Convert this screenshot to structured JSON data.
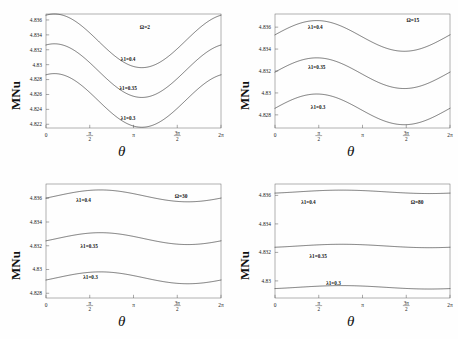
{
  "figure": {
    "axis_labels": {
      "y": "MNu",
      "x": "θ"
    },
    "xtick_labels": [
      "0",
      "π/2",
      "π",
      "3π/2",
      "2π"
    ],
    "xtick_values": [
      0,
      1.5707963,
      3.1415927,
      4.712389,
      6.2831853
    ],
    "curve_series_labels": [
      "λ1=0.4",
      "λ1=0.35",
      "λ1=0.3"
    ]
  },
  "chart_data": [
    {
      "type": "line",
      "title": "Ω=2",
      "panel": "top-left",
      "xlabel": "θ",
      "ylabel": "MNu",
      "xlim": [
        0,
        6.2831853
      ],
      "ylim": [
        4.8215,
        4.8368
      ],
      "xticks": [
        0,
        1.5707963,
        3.1415927,
        4.712389,
        6.2831853
      ],
      "xticklabels": [
        "0",
        "π/2",
        "π",
        "3π/2",
        "2π"
      ],
      "yticks": [
        4.822,
        4.824,
        4.826,
        4.828,
        4.83,
        4.832,
        4.834,
        4.836
      ],
      "yticklabels": [
        "4.822",
        "4.824",
        "4.826",
        "4.828",
        "4.83",
        "4.832",
        "4.834",
        "4.836"
      ],
      "grid": false,
      "legend": "inline-annotations",
      "annotations": [
        {
          "text": "Ω=2",
          "x": 3.55,
          "y": 4.8348
        },
        {
          "text": "λ1=0.4",
          "x": 2.95,
          "y": 4.8305
        },
        {
          "text": "λ1=0.35",
          "x": 2.95,
          "y": 4.8266
        },
        {
          "text": "λ1=0.3",
          "x": 2.95,
          "y": 4.8226
        }
      ],
      "series": [
        {
          "name": "λ1=0.4",
          "mean": 4.8332,
          "amplitude": 0.0036,
          "phase_peak": 0.3,
          "min_at": 3.62
        },
        {
          "name": "λ1=0.35",
          "mean": 4.8292,
          "amplitude": 0.0036,
          "phase_peak": 0.3,
          "min_at": 3.62
        },
        {
          "name": "λ1=0.3",
          "mean": 4.8252,
          "amplitude": 0.0036,
          "phase_peak": 0.3,
          "min_at": 3.62
        }
      ]
    },
    {
      "type": "line",
      "title": "Ω=15",
      "panel": "top-right",
      "xlabel": "θ",
      "ylabel": "MNu",
      "xlim": [
        0,
        6.2831853
      ],
      "ylim": [
        4.8268,
        4.8372
      ],
      "xticks": [
        0,
        1.5707963,
        3.1415927,
        4.712389,
        6.2831853
      ],
      "xticklabels": [
        "0",
        "π/2",
        "π",
        "3π/2",
        "2π"
      ],
      "yticks": [
        4.828,
        4.83,
        4.832,
        4.834,
        4.836
      ],
      "yticklabels": [
        "4.828",
        "4.83",
        "4.832",
        "4.834",
        "4.836"
      ],
      "grid": false,
      "legend": "inline-annotations",
      "annotations": [
        {
          "text": "Ω=15",
          "x": 4.95,
          "y": 4.8365
        },
        {
          "text": "λ1=0.4",
          "x": 1.45,
          "y": 4.8358
        },
        {
          "text": "λ1=0.35",
          "x": 1.5,
          "y": 4.8322
        },
        {
          "text": "λ1=0.3",
          "x": 1.55,
          "y": 4.8285
        }
      ],
      "series": [
        {
          "name": "λ1=0.4",
          "mean": 4.8352,
          "amplitude": 0.0014,
          "phase_peak": 1.5,
          "min_at": 4.65
        },
        {
          "name": "λ1=0.35",
          "mean": 4.8318,
          "amplitude": 0.0014,
          "phase_peak": 1.5,
          "min_at": 4.65
        },
        {
          "name": "λ1=0.3",
          "mean": 4.8285,
          "amplitude": 0.0014,
          "phase_peak": 1.5,
          "min_at": 4.65
        }
      ]
    },
    {
      "type": "line",
      "title": "Ω=30",
      "panel": "bottom-left",
      "xlabel": "θ",
      "ylabel": "MNu",
      "xlim": [
        0,
        6.2831853
      ],
      "ylim": [
        4.8276,
        4.8372
      ],
      "xticks": [
        0,
        1.5707963,
        3.1415927,
        4.712389,
        6.2831853
      ],
      "xticklabels": [
        "0",
        "π/2",
        "π",
        "3π/2",
        "2π"
      ],
      "yticks": [
        4.828,
        4.83,
        4.832,
        4.834,
        4.836
      ],
      "yticklabels": [
        "4.828",
        "4.83",
        "4.832",
        "4.834",
        "4.836"
      ],
      "grid": false,
      "legend": "inline-annotations",
      "annotations": [
        {
          "text": "Ω=30",
          "x": 4.85,
          "y": 4.836
        },
        {
          "text": "λ1=0.4",
          "x": 1.35,
          "y": 4.8357
        },
        {
          "text": "λ1=0.35",
          "x": 1.55,
          "y": 4.8318
        },
        {
          "text": "λ1=0.3",
          "x": 1.6,
          "y": 4.8292
        }
      ],
      "series": [
        {
          "name": "λ1=0.4",
          "mean": 4.8362,
          "amplitude": 0.0005,
          "phase_peak": 1.95,
          "min_at": 5.1
        },
        {
          "name": "λ1=0.35",
          "mean": 4.8326,
          "amplitude": 0.0005,
          "phase_peak": 1.95,
          "min_at": 5.1
        },
        {
          "name": "λ1=0.3",
          "mean": 4.8293,
          "amplitude": 0.0005,
          "phase_peak": 1.95,
          "min_at": 5.1
        }
      ]
    },
    {
      "type": "line",
      "title": "Ω=80",
      "panel": "bottom-right",
      "xlabel": "θ",
      "ylabel": "MNu",
      "xlim": [
        0,
        6.2831853
      ],
      "ylim": [
        4.8288,
        4.8368
      ],
      "xticks": [
        0,
        1.5707963,
        3.1415927,
        4.712389,
        6.2831853
      ],
      "xticklabels": [
        "0",
        "π/2",
        "π",
        "3π/2",
        "2π"
      ],
      "yticks": [
        4.83,
        4.832,
        4.834,
        4.836
      ],
      "yticklabels": [
        "4.83",
        "4.832",
        "4.834",
        "4.836"
      ],
      "grid": false,
      "legend": "inline-annotations",
      "annotations": [
        {
          "text": "Ω=80",
          "x": 5.1,
          "y": 4.8354
        },
        {
          "text": "λ1=0.4",
          "x": 1.2,
          "y": 4.8354
        },
        {
          "text": "λ1=0.35",
          "x": 1.55,
          "y": 4.8316
        },
        {
          "text": "λ1=0.3",
          "x": 2.1,
          "y": 4.8297
        }
      ],
      "series": [
        {
          "name": "λ1=0.4",
          "mean": 4.83625,
          "amplitude": 0.00012,
          "phase_peak": 2.4,
          "min_at": 5.55
        },
        {
          "name": "λ1=0.35",
          "mean": 4.83245,
          "amplitude": 0.00012,
          "phase_peak": 2.4,
          "min_at": 5.55
        },
        {
          "name": "λ1=0.3",
          "mean": 4.82955,
          "amplitude": 0.00012,
          "phase_peak": 2.4,
          "min_at": 5.55
        }
      ]
    }
  ]
}
